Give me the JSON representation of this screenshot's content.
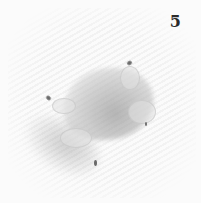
{
  "figure": {
    "page_number": "5",
    "colors": {
      "background": "#fbfbfb",
      "blob": "#b4b4b4",
      "dots": "#6a6a6a",
      "number": "#2a2a2a"
    }
  }
}
